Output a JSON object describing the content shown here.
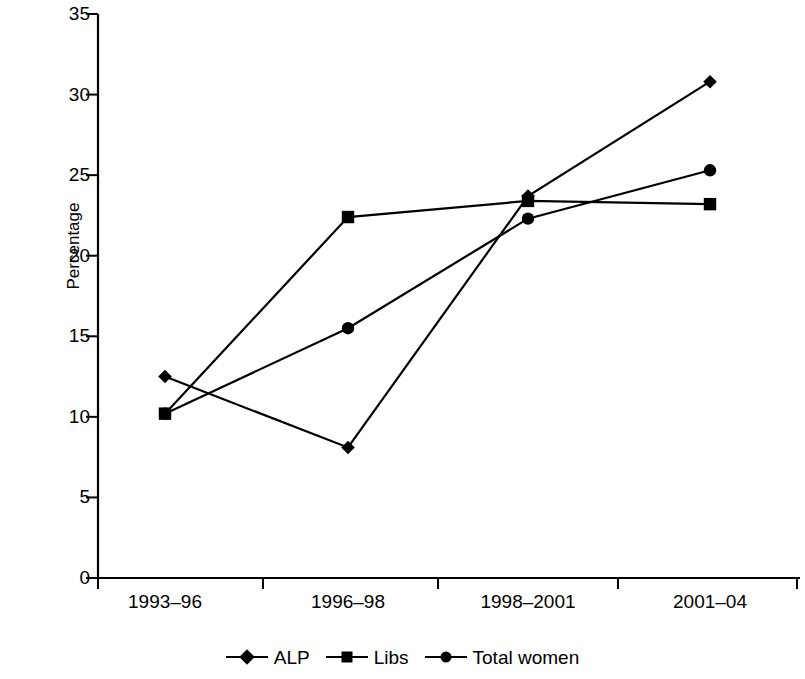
{
  "chart_data": {
    "type": "line",
    "title": "",
    "xlabel": "",
    "ylabel": "Percentage",
    "categories": [
      "1993–96",
      "1996–98",
      "1998–2001",
      "2001–04"
    ],
    "series": [
      {
        "name": "ALP",
        "marker": "diamond",
        "values": [
          12.5,
          8.1,
          23.7,
          30.8
        ]
      },
      {
        "name": "Libs",
        "marker": "square",
        "values": [
          10.2,
          22.4,
          23.4,
          23.2
        ]
      },
      {
        "name": "Total women",
        "marker": "circle",
        "values": [
          10.2,
          15.5,
          22.3,
          25.3
        ]
      }
    ],
    "ylim": [
      0,
      35
    ],
    "yticks": [
      0,
      5,
      10,
      15,
      20,
      25,
      30,
      35
    ],
    "ytick_labels": [
      "0",
      "5",
      "10",
      "15",
      "20",
      "25",
      "30",
      "35"
    ],
    "grid": false,
    "legend_position": "bottom",
    "line_color": "#000000",
    "axis_color": "#000000",
    "background_color": "#ffffff"
  },
  "legend": {
    "entries": [
      {
        "label": "ALP",
        "marker": "diamond"
      },
      {
        "label": "Libs",
        "marker": "square"
      },
      {
        "label": "Total women",
        "marker": "circle"
      }
    ]
  },
  "axes": {
    "y_title": "Percentage"
  }
}
